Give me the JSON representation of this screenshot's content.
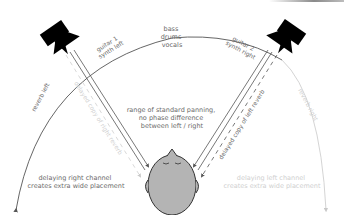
{
  "diagram": {
    "colors": {
      "dark_line": "#555555",
      "light_line": "#c8c8c8",
      "dark_text": "#6a6a6a",
      "light_text": "#cfcfcf",
      "speaker": "#000000",
      "head_fill": "#b4b4b4",
      "head_stroke": "#333333"
    },
    "labels": {
      "center": [
        "bass",
        "drums",
        "vocals"
      ],
      "left_source": [
        "guitar 1",
        "synth left"
      ],
      "right_source": [
        "guitar 2",
        "synth right"
      ],
      "center_range": [
        "range of standard panning,",
        "no phase difference",
        "between left / right"
      ],
      "reverb_left": "reverb left",
      "reverb_right": "reverb right",
      "delayed_copy_right": "delayed copy of right reverb",
      "delayed_copy_left": "delayed copy of left reverb",
      "left_bottom": [
        "delaying right channel",
        "creates extra wide placement"
      ],
      "right_bottom": [
        "delaying left channel",
        "creates extra wide placement"
      ]
    },
    "nodes": [
      {
        "id": "speaker-left",
        "type": "loudspeaker"
      },
      {
        "id": "speaker-right",
        "type": "loudspeaker"
      },
      {
        "id": "listener-head",
        "type": "head"
      }
    ]
  }
}
